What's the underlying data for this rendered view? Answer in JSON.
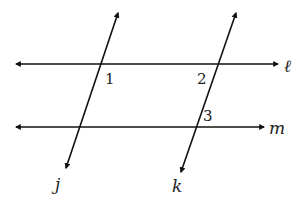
{
  "diagram": {
    "type": "parallel lines cut by transversals",
    "stroke_color": "#111111",
    "background": "#ffffff",
    "lines": {
      "l": {
        "name": "ℓ",
        "x1": 16,
        "y1": 64,
        "x2": 278,
        "y2": 64,
        "label_x": 284,
        "label_y": 72
      },
      "m": {
        "name": "m",
        "x1": 16,
        "y1": 127,
        "x2": 264,
        "y2": 127,
        "label_x": 269,
        "label_y": 134
      },
      "j": {
        "name": "j",
        "x1": 118,
        "y1": 13,
        "x2": 66,
        "y2": 168,
        "label_x": 55,
        "label_y": 190
      },
      "k": {
        "name": "k",
        "x1": 236,
        "y1": 13,
        "x2": 181,
        "y2": 172,
        "label_x": 172,
        "label_y": 192
      }
    },
    "angles": [
      {
        "id": "1",
        "label": "1",
        "x": 105,
        "y": 84
      },
      {
        "id": "2",
        "label": "2",
        "x": 197,
        "y": 84
      },
      {
        "id": "3",
        "label": "3",
        "x": 203,
        "y": 121
      }
    ]
  }
}
